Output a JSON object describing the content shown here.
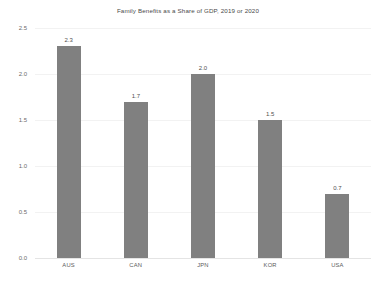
{
  "chart_data": {
    "type": "bar",
    "title": "Family Benefits as a Share of GDP, 2019 or 2020",
    "xlabel": "",
    "ylabel": "",
    "categories": [
      "AUS",
      "CAN",
      "JPN",
      "KOR",
      "USA"
    ],
    "values": [
      2.3,
      1.7,
      2.0,
      1.5,
      0.7
    ],
    "data_labels": [
      "2.3",
      "1.7",
      "2.0",
      "1.5",
      "0.7"
    ],
    "ylim": [
      0.0,
      2.5
    ],
    "ytick_values": [
      0.0,
      0.5,
      1.0,
      1.5,
      2.0,
      2.5
    ],
    "ytick_labels": [
      "0.0",
      "0.5",
      "1.0",
      "1.5",
      "2.0",
      "2.5"
    ],
    "grid": true,
    "grid_axis": "y",
    "legend": false,
    "legend_position": "none",
    "bar_color": "#808080",
    "gridline_color": "#f2f2f2",
    "background_color": "#ffffff",
    "text_color": "#595959"
  }
}
